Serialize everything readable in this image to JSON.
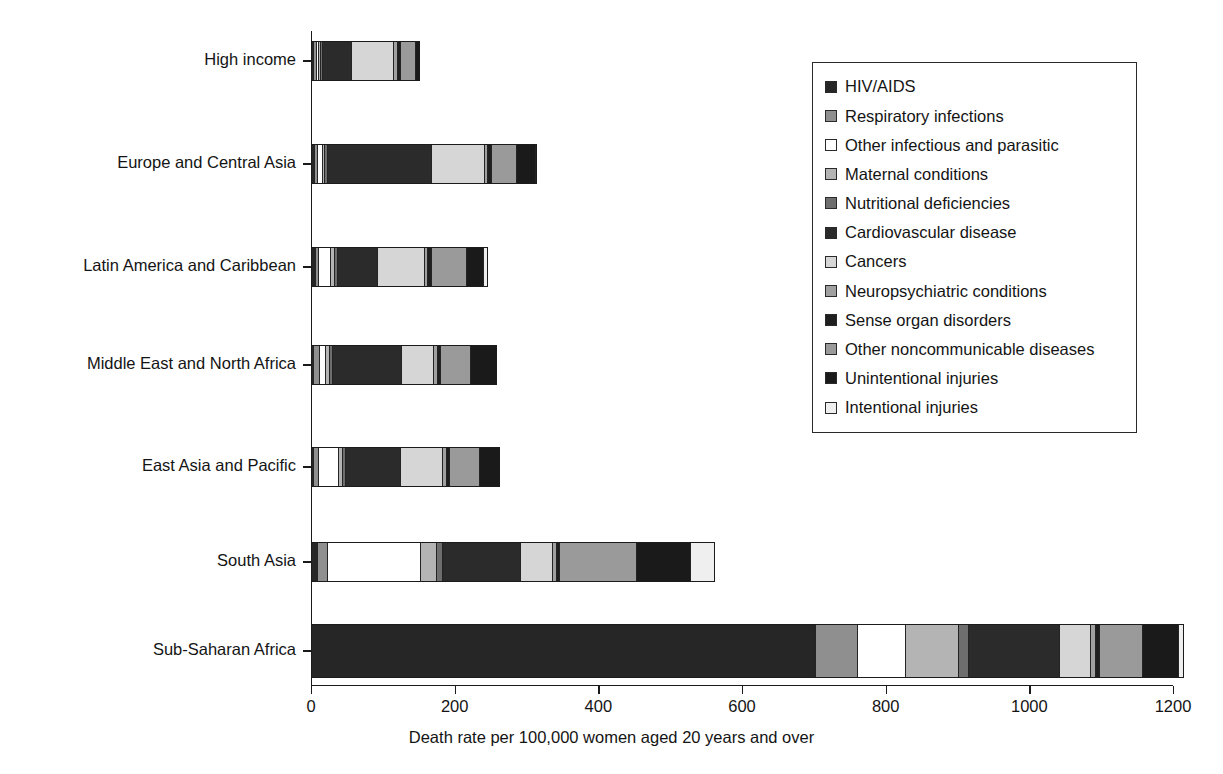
{
  "chart_data": {
    "type": "bar",
    "orientation": "horizontal",
    "stacked": true,
    "title": "",
    "xlabel": "Death rate per 100,000 women aged 20 years and over",
    "ylabel": "",
    "xlim": [
      0,
      1200
    ],
    "xticks": [
      0,
      200,
      400,
      600,
      800,
      1000,
      1200
    ],
    "xtick_labels": [
      "0",
      "200",
      "400",
      "600",
      "800",
      "1000",
      "1200"
    ],
    "grid": false,
    "legend_position": "upper right",
    "categories": [
      "High income",
      "Europe and Central Asia",
      "Latin America and Caribbean",
      "Middle East and North Africa",
      "East Asia and Pacific",
      "South Asia",
      "Sub-Saharan Africa"
    ],
    "series": [
      {
        "name": "HIV/AIDS",
        "color": "#262626",
        "values": [
          1.5,
          2.5,
          4.0,
          1.0,
          2.0,
          7.0,
          700.0
        ]
      },
      {
        "name": "Respiratory infections",
        "color": "#8f8f8f",
        "values": [
          2.5,
          3.0,
          3.0,
          7.0,
          5.0,
          13.0,
          57.0
        ]
      },
      {
        "name": "Other infectious and parasitic",
        "color": "#ffffff",
        "values": [
          2.0,
          5.0,
          16.0,
          8.0,
          27.0,
          128.0,
          66.0
        ]
      },
      {
        "name": "Maternal conditions",
        "color": "#b4b4b4",
        "values": [
          1.0,
          2.0,
          3.0,
          3.0,
          3.0,
          21.0,
          72.0
        ]
      },
      {
        "name": "Nutritional deficiencies",
        "color": "#6e6e6e",
        "values": [
          1.0,
          3.0,
          3.0,
          3.0,
          4.0,
          7.0,
          12.0
        ]
      },
      {
        "name": "Cardiovascular disease",
        "color": "#2b2b2b",
        "values": [
          40.0,
          143.0,
          54.0,
          95.0,
          75.0,
          106.0,
          126.0
        ]
      },
      {
        "name": "Cancers",
        "color": "#d6d6d6",
        "values": [
          57.0,
          72.0,
          64.0,
          43.0,
          57.0,
          44.0,
          42.0
        ]
      },
      {
        "name": "Neuropsychiatric conditions",
        "color": "#a0a0a0",
        "values": [
          4.0,
          4.0,
          4.0,
          4.0,
          4.0,
          4.0,
          6.0
        ]
      },
      {
        "name": "Sense organ disorders",
        "color": "#1f1f1f",
        "values": [
          2.0,
          3.0,
          3.0,
          3.0,
          3.0,
          3.0,
          4.0
        ]
      },
      {
        "name": "Other noncommunicable diseases",
        "color": "#9a9a9a",
        "values": [
          20.0,
          34.0,
          48.0,
          40.0,
          40.0,
          105.0,
          58.0
        ]
      },
      {
        "name": "Unintentional injuries",
        "color": "#1a1a1a",
        "values": [
          12.0,
          25.0,
          22.0,
          36.0,
          27.0,
          74.0,
          49.0
        ]
      },
      {
        "name": "Intentional injuries",
        "color": "#efefef",
        "values": [
          6.0,
          16.0,
          20.0,
          13.0,
          13.0,
          48.0,
          21.0
        ]
      }
    ],
    "totals": [
      149.0,
      312.5,
      244.0,
      256.0,
      260.0,
      560.0,
      1213.0
    ]
  },
  "axis": {
    "x_title": "Death rate per 100,000 women aged 20 years and over"
  }
}
